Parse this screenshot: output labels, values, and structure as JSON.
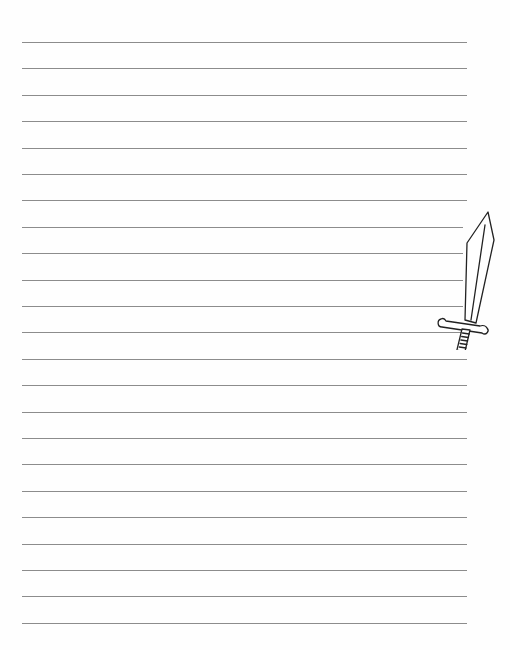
{
  "page": {
    "type": "lined-writing-paper",
    "background_color": "#fefefe",
    "line_color": "#8c8c8c",
    "line_count": 23,
    "first_line_y": 42,
    "line_spacing": 26.4,
    "line_left": 22,
    "line_width": 445
  },
  "decoration": {
    "icon": "sword-icon",
    "stroke_color": "#222222",
    "fill_color": "#ffffff"
  }
}
